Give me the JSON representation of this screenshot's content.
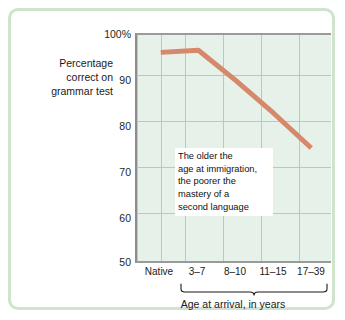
{
  "figure": {
    "frame_color": "#cfe3cd",
    "plot_bg_color": "#e6f1ea",
    "line_color": "#d6886a",
    "grid_color": "#b9c9c0"
  },
  "axes": {
    "y_title_lines": [
      "Percentage",
      "correct on",
      "grammar test"
    ],
    "y_ticks": [
      "100%",
      "90",
      "80",
      "70",
      "60",
      "50"
    ],
    "x_ticks": [
      "Native",
      "3–7",
      "8–10",
      "11–15",
      "17–39"
    ],
    "x_title": "Age at arrival, in years"
  },
  "annotation": {
    "lines": [
      "The older the",
      "age at immigration,",
      "the poorer the",
      "mastery of a",
      "second language"
    ]
  },
  "chart_data": {
    "type": "line",
    "title": "",
    "xlabel": "Age at arrival, in years",
    "ylabel": "Percentage correct on grammar test",
    "categories": [
      "Native",
      "3–7",
      "8–10",
      "11–15",
      "17–39"
    ],
    "values": [
      98,
      98.5,
      91.5,
      84,
      76
    ],
    "series": [
      {
        "name": "Percentage correct on grammar test",
        "values": [
          98,
          98.5,
          91.5,
          84,
          76
        ]
      }
    ],
    "ylim": [
      50,
      102
    ],
    "yticks": [
      50,
      60,
      70,
      80,
      90,
      100
    ],
    "ytick_labels": [
      "50",
      "60",
      "70",
      "80",
      "90",
      "100%"
    ],
    "grid": true,
    "legend": "none",
    "line_color": "#d6886a",
    "annotations": [
      "The older the age at immigration, the poorer the mastery of a second language"
    ]
  }
}
